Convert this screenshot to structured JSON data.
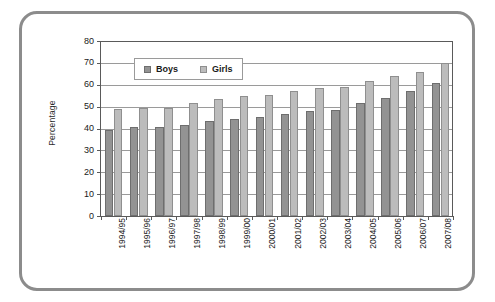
{
  "chart_data": {
    "type": "bar",
    "title": "",
    "xlabel": "",
    "ylabel": "Percentage",
    "ylim": [
      0,
      80
    ],
    "yticks": [
      0,
      10,
      20,
      30,
      40,
      50,
      60,
      70,
      80
    ],
    "grid": true,
    "legend_position": "top-left-inside",
    "categories": [
      "1994/95",
      "1995/96",
      "1996/97",
      "1997/98",
      "1998/99",
      "1999/00",
      "2000/01",
      "2001/02",
      "2002/03",
      "2003/04",
      "2004/05",
      "2005/06",
      "2006/07",
      "2007/08"
    ],
    "series": [
      {
        "name": "Boys",
        "color": "#939393",
        "values": [
          39.5,
          40.6,
          40.8,
          41.8,
          43.3,
          44.5,
          45.4,
          46.7,
          48.1,
          48.6,
          51.7,
          54.1,
          57.1,
          61.0
        ]
      },
      {
        "name": "Girls",
        "color": "#bcbcbc",
        "values": [
          48.8,
          49.4,
          49.5,
          51.5,
          53.6,
          54.7,
          55.5,
          57.0,
          58.4,
          58.8,
          61.9,
          63.8,
          65.8,
          70.0
        ]
      }
    ]
  },
  "figure": {
    "border_color": "#8c8c8c",
    "background": "#ffffff"
  }
}
